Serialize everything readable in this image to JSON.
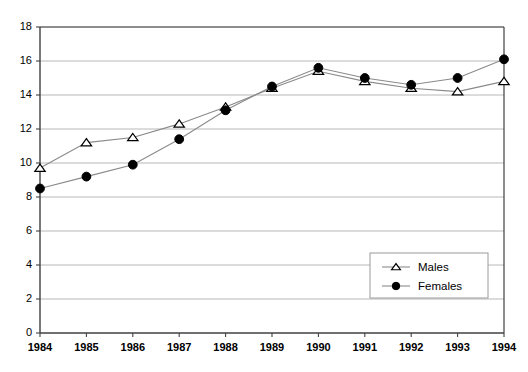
{
  "chart_data": {
    "type": "line",
    "title": "",
    "subtitle": "",
    "xlabel": "",
    "ylabel": "",
    "categories": [
      "1984",
      "1985",
      "1986",
      "1987",
      "1988",
      "1989",
      "1990",
      "1991",
      "1992",
      "1993",
      "1994"
    ],
    "x": [
      1984,
      1985,
      1986,
      1987,
      1988,
      1989,
      1990,
      1991,
      1992,
      1993,
      1994
    ],
    "series": [
      {
        "name": "Males",
        "marker": "open-triangle",
        "color": "#000000",
        "values": [
          9.7,
          11.2,
          11.5,
          12.3,
          13.3,
          14.4,
          15.4,
          14.8,
          14.4,
          14.2,
          14.8
        ]
      },
      {
        "name": "Females",
        "marker": "filled-circle",
        "color": "#000000",
        "values": [
          8.5,
          9.2,
          9.9,
          11.4,
          13.1,
          14.5,
          15.6,
          15.0,
          14.6,
          15.0,
          16.1
        ]
      }
    ],
    "ylim": [
      0,
      18
    ],
    "yticks": [
      0,
      2,
      4,
      6,
      8,
      10,
      12,
      14,
      16,
      18
    ],
    "ytick_labels": [
      "0",
      "2",
      "4",
      "6",
      "8",
      "10",
      "12",
      "14",
      "16",
      "18"
    ],
    "xlim": [
      1984,
      1994
    ],
    "grid": "horizontal",
    "grid_color": "#b0b0b0",
    "plot_background": "#ffffff",
    "axis_color": "#404040",
    "legend": {
      "position": "inside-bottom-right",
      "entries": [
        {
          "label": "Males",
          "marker": "open-triangle"
        },
        {
          "label": "Females",
          "marker": "filled-circle"
        }
      ]
    }
  }
}
